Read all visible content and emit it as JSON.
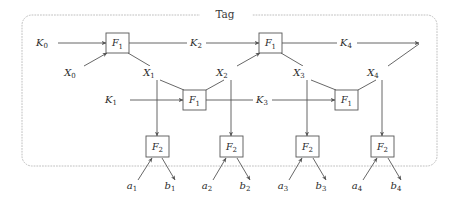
{
  "figure": {
    "title": "Tag",
    "kind": "feistel-style-tag-generation-diagram",
    "background_color": "#ffffff",
    "wire_color": "#565656",
    "group_border_color": "#b9b9b9",
    "text_color": "#2b2b2b"
  },
  "functions": {
    "f1_label": "F",
    "f1_sub": "1",
    "f2_label": "F",
    "f2_sub": "2"
  },
  "boxes": [
    {
      "name": "f1-top-left",
      "label": "F",
      "sub": "1",
      "x": 106,
      "y": 33,
      "w": 23,
      "h": 20
    },
    {
      "name": "f1-top-right",
      "label": "F",
      "sub": "1",
      "x": 259,
      "y": 33,
      "w": 23,
      "h": 20
    },
    {
      "name": "f1-mid-left",
      "label": "F",
      "sub": "1",
      "x": 183,
      "y": 90,
      "w": 23,
      "h": 20
    },
    {
      "name": "f1-mid-right",
      "label": "F",
      "sub": "1",
      "x": 335,
      "y": 90,
      "w": 23,
      "h": 20
    },
    {
      "name": "f2-1",
      "label": "F",
      "sub": "2",
      "x": 146,
      "y": 136,
      "w": 23,
      "h": 21
    },
    {
      "name": "f2-2",
      "label": "F",
      "sub": "2",
      "x": 220,
      "y": 136,
      "w": 23,
      "h": 21
    },
    {
      "name": "f2-3",
      "label": "F",
      "sub": "2",
      "x": 296,
      "y": 136,
      "w": 23,
      "h": 21
    },
    {
      "name": "f2-4",
      "label": "F",
      "sub": "2",
      "x": 371,
      "y": 136,
      "w": 23,
      "h": 21
    }
  ],
  "labels": {
    "keys_top": [
      {
        "name": "K0",
        "base": "K",
        "sub": "0",
        "x": 42,
        "y": 46
      },
      {
        "name": "K2",
        "base": "K",
        "sub": "2",
        "x": 196,
        "y": 46
      },
      {
        "name": "K4",
        "base": "K",
        "sub": "4",
        "x": 346,
        "y": 46
      }
    ],
    "keys_mid": [
      {
        "name": "K1",
        "base": "K",
        "sub": "1",
        "x": 111,
        "y": 103
      },
      {
        "name": "K3",
        "base": "K",
        "sub": "3",
        "x": 262,
        "y": 103
      }
    ],
    "states": [
      {
        "name": "X0",
        "base": "X",
        "sub": "0",
        "x": 70,
        "y": 76
      },
      {
        "name": "X1",
        "base": "X",
        "sub": "1",
        "x": 149,
        "y": 76
      },
      {
        "name": "X2",
        "base": "X",
        "sub": "2",
        "x": 222,
        "y": 76
      },
      {
        "name": "X3",
        "base": "X",
        "sub": "3",
        "x": 299,
        "y": 76
      },
      {
        "name": "X4",
        "base": "X",
        "sub": "4",
        "x": 373,
        "y": 76
      }
    ],
    "outputs": [
      {
        "name": "a1",
        "base": "a",
        "sub": "1",
        "x": 132,
        "y": 189
      },
      {
        "name": "b1",
        "base": "b",
        "sub": "1",
        "x": 170,
        "y": 189
      },
      {
        "name": "a2",
        "base": "a",
        "sub": "2",
        "x": 207,
        "y": 189
      },
      {
        "name": "b2",
        "base": "b",
        "sub": "2",
        "x": 245,
        "y": 189
      },
      {
        "name": "a3",
        "base": "a",
        "sub": "3",
        "x": 283,
        "y": 189
      },
      {
        "name": "b3",
        "base": "b",
        "sub": "3",
        "x": 321,
        "y": 189
      },
      {
        "name": "a4",
        "base": "a",
        "sub": "4",
        "x": 357,
        "y": 189
      },
      {
        "name": "b4",
        "base": "b",
        "sub": "4",
        "x": 396,
        "y": 189
      }
    ]
  },
  "group_box": {
    "x": 22,
    "y": 15,
    "w": 415,
    "h": 151,
    "r": 10,
    "title_x": 225,
    "title_y": 18
  }
}
